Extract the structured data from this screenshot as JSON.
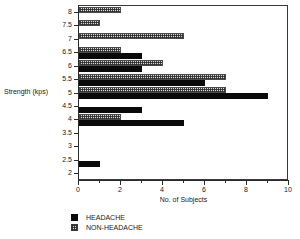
{
  "chart_data": {
    "type": "bar",
    "orientation": "horizontal",
    "title": "",
    "xlabel": "No. of Subjects",
    "ylabel": "Strength (kps)",
    "xlim": [
      0,
      10
    ],
    "x_major_ticks": [
      0,
      2,
      4,
      6,
      8,
      10
    ],
    "x_minor_ticks": [
      1,
      3,
      5,
      7,
      9
    ],
    "x_tick_labels": [
      "0",
      "2",
      "4",
      "6",
      "8",
      "10"
    ],
    "categories": [
      "8",
      "7.5",
      "7",
      "6.5",
      "6",
      "5.5",
      "5",
      "4.5",
      "4",
      "3.5",
      "3",
      "2.5",
      "2"
    ],
    "grid": false,
    "legend_position": "below-left",
    "series": [
      {
        "name": "HEADACHE",
        "fill": "solid-black",
        "color": "#0a0a0a",
        "values": [
          0,
          0,
          0,
          3,
          3,
          6,
          9,
          3,
          5,
          0,
          0,
          1,
          0
        ]
      },
      {
        "name": "NON-HEADACHE",
        "fill": "hatched-gray",
        "color": "#d9d9d9",
        "values": [
          2,
          1,
          5,
          2,
          4,
          7,
          7,
          0,
          2,
          0,
          0,
          0,
          0
        ]
      }
    ]
  },
  "legend": {
    "items": [
      {
        "label": "HEADACHE",
        "swatch": "solid-black-swatch"
      },
      {
        "label": "NON-HEADACHE",
        "swatch": "hatched-gray-swatch"
      }
    ]
  }
}
